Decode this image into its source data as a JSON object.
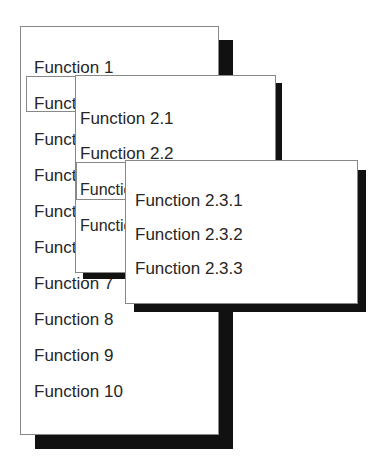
{
  "menu1": {
    "items": [
      "Function 1",
      "Function 2",
      "Function 3",
      "Function 4",
      "Function 5",
      "Function 6",
      "Function 7",
      "Function 8",
      "Function 9",
      "Function 10"
    ]
  },
  "menu2": {
    "items": [
      "Function 2.1",
      "Function 2.2",
      "Function 2.3",
      "Function 2.4"
    ]
  },
  "menu3": {
    "items": [
      "Function 2.3.1",
      "Function 2.3.2",
      "Function 2.3.3"
    ]
  }
}
